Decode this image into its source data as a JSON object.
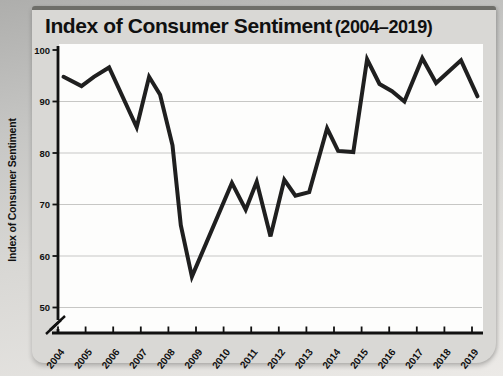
{
  "figure": {
    "title_main": "Index of Consumer Sentiment",
    "title_range": "(2004–2019)"
  },
  "chart_data": {
    "type": "line",
    "xlabel": "",
    "ylabel": "Index of Consumer Sentiment",
    "x_tick_labels": [
      "2004",
      "2005",
      "2006",
      "2007",
      "2008",
      "2009",
      "2010",
      "2011",
      "2012",
      "2013",
      "2014",
      "2015",
      "2016",
      "2017",
      "2018",
      "2019"
    ],
    "x_tick_years": [
      2004,
      2005,
      2006,
      2007,
      2008,
      2009,
      2010,
      2011,
      2012,
      2013,
      2014,
      2015,
      2016,
      2017,
      2018,
      2019
    ],
    "y_ticks": [
      100,
      90,
      80,
      70,
      60,
      50
    ],
    "ylim": [
      50,
      100
    ],
    "xlim": [
      2004,
      2019.4
    ],
    "axis_break_at_bottom": true,
    "grid": "horizontal",
    "legend": "none",
    "series": [
      {
        "name": "Index of Consumer Sentiment",
        "points": [
          [
            2004.2,
            94.8
          ],
          [
            2004.85,
            93.0
          ],
          [
            2005.3,
            94.8
          ],
          [
            2005.85,
            96.6
          ],
          [
            2006.85,
            85.0
          ],
          [
            2007.3,
            94.8
          ],
          [
            2007.7,
            91.3
          ],
          [
            2008.15,
            81.5
          ],
          [
            2008.45,
            66.0
          ],
          [
            2008.85,
            56.0
          ],
          [
            2010.3,
            74.2
          ],
          [
            2010.8,
            69.0
          ],
          [
            2011.2,
            74.4
          ],
          [
            2011.7,
            63.8
          ],
          [
            2012.2,
            74.8
          ],
          [
            2012.6,
            71.7
          ],
          [
            2013.1,
            72.4
          ],
          [
            2013.75,
            84.8
          ],
          [
            2014.15,
            80.4
          ],
          [
            2014.7,
            80.2
          ],
          [
            2015.2,
            98.2
          ],
          [
            2015.65,
            93.4
          ],
          [
            2016.1,
            92.0
          ],
          [
            2016.55,
            90.0
          ],
          [
            2017.2,
            98.4
          ],
          [
            2017.7,
            93.6
          ],
          [
            2018.6,
            98.0
          ],
          [
            2019.2,
            91.0
          ]
        ]
      }
    ]
  },
  "colors": {
    "line": "#1f1f1f",
    "axis": "#111111",
    "grid": "#c7c7c5",
    "plot_bg": "#fdfdfc",
    "card_bg": "#d9d8d5",
    "text": "#111111"
  }
}
